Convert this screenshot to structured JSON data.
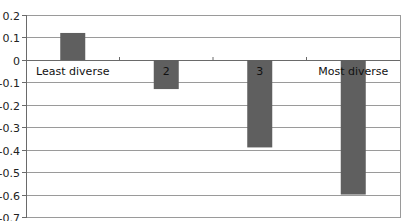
{
  "chart_data": {
    "type": "bar",
    "title": "",
    "xlabel": "",
    "ylabel": "",
    "categories": [
      "Least diverse",
      "2",
      "3",
      "Most diverse"
    ],
    "values": [
      0.12,
      -0.13,
      -0.39,
      -0.6
    ],
    "ylim": [
      -0.7,
      0.2
    ],
    "yticks": [
      0.2,
      0.1,
      0,
      -0.1,
      -0.2,
      -0.3,
      -0.4,
      -0.5,
      -0.6,
      -0.7
    ],
    "ytick_labels": [
      "0.2",
      "0.1",
      "0",
      "-0.1",
      "-0.2",
      "-0.3",
      "-0.4",
      "-0.5",
      "-0.6",
      "-0.7"
    ],
    "grid": true,
    "legend": null,
    "bar_color": "#5f5f5f",
    "grid_color": "#9a9a9a"
  }
}
